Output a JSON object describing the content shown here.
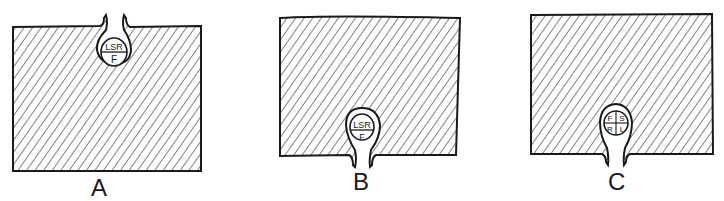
{
  "figure": {
    "panels": [
      {
        "id": "A",
        "caption": "A",
        "pocket_position": "top",
        "cell_labels": [
          "LSR",
          "F"
        ]
      },
      {
        "id": "B",
        "caption": "B",
        "pocket_position": "bottom",
        "cell_labels": [
          "LSR",
          "F"
        ]
      },
      {
        "id": "C",
        "caption": "C",
        "pocket_position": "bottom",
        "cell_labels": [
          "F",
          "S",
          "R",
          "L"
        ]
      }
    ],
    "colors": {
      "ink": "#1a1a1a",
      "background": "#ffffff"
    }
  }
}
